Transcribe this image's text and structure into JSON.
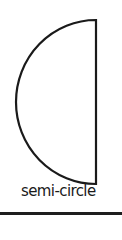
{
  "figure": {
    "label": "semi-circle",
    "shape": "semi-circle",
    "stroke_color": "#1a1a1a",
    "fill_color": "#ffffff"
  }
}
